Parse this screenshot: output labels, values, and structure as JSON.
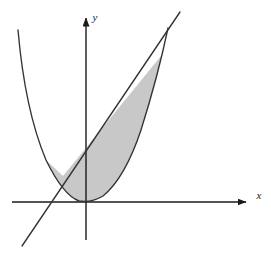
{
  "figure": {
    "title": "",
    "caption": "",
    "background_color": "#ffffff"
  },
  "axes": {
    "x_axis": {
      "label": "x",
      "name": "x-axis",
      "origin_px": [
        86,
        202
      ],
      "start_px": [
        12,
        202
      ],
      "end_px": [
        252,
        202
      ],
      "has_arrow": true,
      "color": "#1a1a1a",
      "width": 1.4
    },
    "y_axis": {
      "label": "y",
      "name": "y-axis",
      "origin_px": [
        86,
        202
      ],
      "start_px": [
        86,
        240
      ],
      "end_px": [
        86,
        12
      ],
      "has_arrow": true,
      "color": "#1a1a1a",
      "width": 1.4
    },
    "label_positions": {
      "x_label_px": [
        259,
        199
      ],
      "y_label_px": [
        95,
        18
      ]
    }
  },
  "chart_data": {
    "type": "line",
    "title": "",
    "xlabel": "x",
    "ylabel": "y",
    "grid": false,
    "legend": "none",
    "xlim": [
      -2.2,
      5.0
    ],
    "ylim": [
      -1.1,
      6.2
    ],
    "annotations": [],
    "series": [
      {
        "name": "parabola",
        "kind": "curve",
        "equation": "y = x^2",
        "color": "#333333",
        "linewidth": 1.3,
        "x": [
          -2.0,
          -1.75,
          -1.5,
          -1.25,
          -1.0,
          -0.75,
          -0.5,
          -0.25,
          0.0,
          0.25,
          0.5,
          0.75,
          1.0,
          1.25,
          1.5,
          1.75,
          2.0,
          2.25,
          2.35
        ],
        "y": [
          4.0,
          3.0625,
          2.25,
          1.5625,
          1.0,
          0.5625,
          0.25,
          0.0625,
          0.0,
          0.0625,
          0.25,
          0.5625,
          1.0,
          1.5625,
          2.25,
          3.0625,
          4.0,
          5.0625,
          5.5225
        ]
      },
      {
        "name": "line",
        "kind": "straight-line",
        "equation": "y = x + 2",
        "color": "#333333",
        "linewidth": 1.3,
        "x": [
          -2.0,
          2.5
        ],
        "y": [
          0.0,
          4.5
        ]
      }
    ],
    "shaded_region": {
      "name": "region-between-curves",
      "fill_color": "#c8c8c8",
      "fill_opacity": 1.0,
      "bounded_above_by": "line",
      "bounded_below_by": "parabola",
      "x_from": -1.0,
      "x_to": 2.0,
      "description": "Region enclosed between the parabola and the line"
    },
    "intersections": [
      {
        "name": "left-intersection",
        "x": -1.0,
        "y": 1.0,
        "px": [
          63,
          176
        ]
      },
      {
        "name": "right-intersection",
        "x": 2.0,
        "y": 4.0,
        "px": [
          161,
          56
        ]
      }
    ],
    "vertex": {
      "name": "parabola-vertex",
      "x": 0.0,
      "y": 0.0,
      "px": [
        91,
        201
      ]
    }
  },
  "geometry_px": {
    "parabola_path": "M 18,30 Q 25,110 46,160 Q 63,195 79,201 Q 91,203 103,196 Q 125,178 141,130 Q 158,76 168,28",
    "line_path": "M 22,246 L 180,12",
    "shaded_path": "M 63,176 L 161,56 Q 158,76 141,130 Q 125,178 103,196 Q 91,203 79,201 Q 63,195 46,160 Z",
    "shaded_fill": "#c8c8c8"
  },
  "colors": {
    "stroke": "#333333",
    "axis": "#1a1a1a",
    "fill": "#c8c8c8",
    "background": "#ffffff"
  }
}
